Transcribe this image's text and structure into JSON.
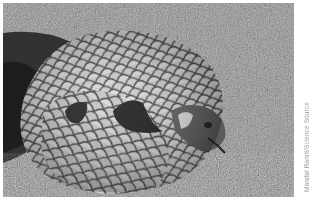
{
  "figure": {
    "photo": {
      "subject": "pangolin curled up on grass",
      "style": "grayscale photograph",
      "alt": "Pangolin curled into a ball on grassy ground"
    },
    "credit": "Mandal Ranjit/Science Source",
    "caption_partial": ""
  },
  "colors": {
    "background": "#ffffff",
    "grass_mid": "#8a8a8a",
    "scale_light": "#d8d8d8",
    "scale_edge": "#3a3a3a",
    "credit_text": "#9a9a9a"
  }
}
